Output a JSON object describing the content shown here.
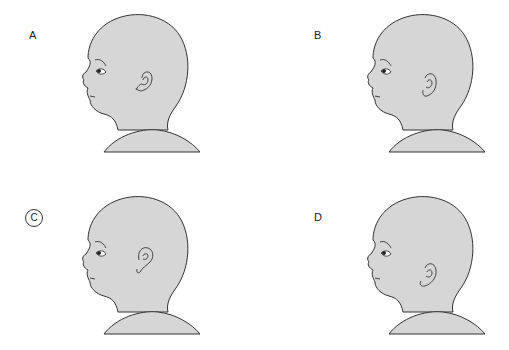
{
  "figure": {
    "fill_color": "#d6d6d6",
    "stroke_color": "#333333",
    "panels": [
      {
        "id": "A",
        "label": "A",
        "selected": false,
        "ear_offset_y": 0,
        "ear_shape": "curled"
      },
      {
        "id": "B",
        "label": "B",
        "selected": false,
        "ear_offset_y": 2,
        "ear_shape": "upright"
      },
      {
        "id": "C",
        "label": "C",
        "selected": true,
        "ear_offset_y": -4,
        "ear_shape": "high"
      },
      {
        "id": "D",
        "label": "D",
        "selected": false,
        "ear_offset_y": 8,
        "ear_shape": "low-set"
      }
    ]
  }
}
